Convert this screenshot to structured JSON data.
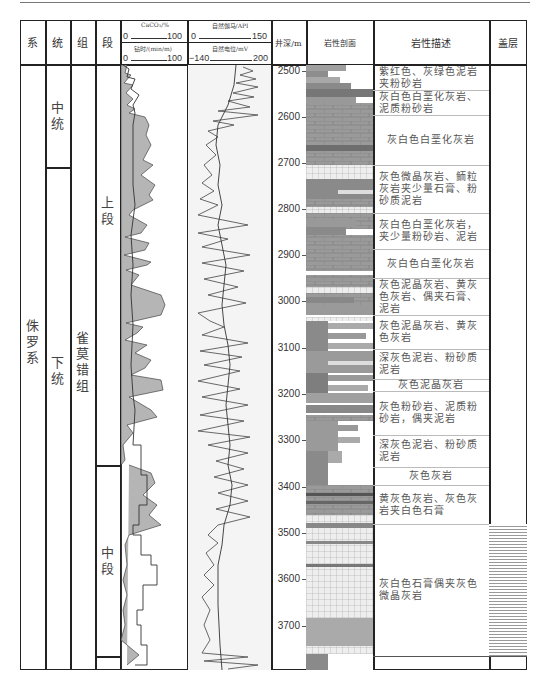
{
  "header": {
    "system": "系",
    "series": "统",
    "formation": "组",
    "member": "段",
    "caco3_label": "CaCO₃/%",
    "caco3_min": "0",
    "caco3_max": "100",
    "drill_label": "钻时/(min/m)",
    "drill_min": "0",
    "drill_max": "100",
    "gr_label": "自然伽马/API",
    "gr_min": "0",
    "gr_max": "150",
    "sp_label": "自然电位/mV",
    "sp_min": "−140",
    "sp_max": "200",
    "depth": "井深/m",
    "litho_profile": "岩性剖面",
    "litho_desc": "岩性描述",
    "caprock": "盖层"
  },
  "strat": {
    "system": "侏罗系",
    "series": [
      {
        "name": "中统",
        "top": 65,
        "bottom": 168
      },
      {
        "name": "下统",
        "top": 168,
        "bottom": 670
      }
    ],
    "formation": "雀莫错组",
    "members": [
      {
        "name": "上段",
        "top": 65,
        "bottom": 465
      },
      {
        "name": "中段",
        "top": 465,
        "bottom": 656
      },
      {
        "name": "",
        "top": 656,
        "bottom": 670
      }
    ]
  },
  "depth_ticks": [
    {
      "label": "2500",
      "y": 70
    },
    {
      "label": "2600",
      "y": 116
    },
    {
      "label": "2700",
      "y": 162
    },
    {
      "label": "2800",
      "y": 208
    },
    {
      "label": "2900",
      "y": 254
    },
    {
      "label": "3000",
      "y": 300
    },
    {
      "label": "3100",
      "y": 347
    },
    {
      "label": "3200",
      "y": 393
    },
    {
      "label": "3300",
      "y": 439
    },
    {
      "label": "3400",
      "y": 486
    },
    {
      "label": "3500",
      "y": 532
    },
    {
      "label": "3600",
      "y": 578
    },
    {
      "label": "3700",
      "y": 625
    }
  ],
  "descriptions": [
    {
      "text": "紫红色、灰绿色泥岩夹粉砂岩",
      "top": 65,
      "bottom": 90
    },
    {
      "text": "灰白色白垩化灰岩、泥质粉砂岩",
      "top": 90,
      "bottom": 115
    },
    {
      "text": "灰白色白垩化灰岩",
      "top": 115,
      "bottom": 165
    },
    {
      "text": "灰色微晶灰岩、鲕粒灰岩夹少量石膏、粉砂质泥岩",
      "top": 165,
      "bottom": 213
    },
    {
      "text": "灰白色白垩化灰岩，夹少量粉砂岩、泥岩",
      "top": 213,
      "bottom": 249
    },
    {
      "text": "灰白色白垩化灰岩",
      "top": 249,
      "bottom": 278
    },
    {
      "text": "灰色泥晶灰岩、黄灰色灰岩、偶夹石膏、泥岩",
      "top": 278,
      "bottom": 315
    },
    {
      "text": "灰色泥晶灰岩、黄灰色灰岩",
      "top": 315,
      "bottom": 349
    },
    {
      "text": "深灰色泥岩、粉砂质泥岩",
      "top": 349,
      "bottom": 379
    },
    {
      "text": "灰色泥晶灰岩",
      "top": 379,
      "bottom": 391
    },
    {
      "text": "灰色粉砂岩、泥质粉砂岩，偶夹泥岩",
      "top": 391,
      "bottom": 435
    },
    {
      "text": "深灰色泥岩、粉砂质泥岩",
      "top": 435,
      "bottom": 467
    },
    {
      "text": "灰色灰岩",
      "top": 467,
      "bottom": 485
    },
    {
      "text": "黄灰色灰岩、灰色灰岩夹白色石膏",
      "top": 485,
      "bottom": 524
    },
    {
      "text": "灰白色石膏偶夹灰色微晶灰岩",
      "top": 524,
      "bottom": 656
    },
    {
      "text": "",
      "top": 656,
      "bottom": 670
    }
  ],
  "caprock": {
    "top": 524,
    "bottom": 656,
    "pattern": "horizontal-lines"
  },
  "colors": {
    "grid": "#222222",
    "fill": "#b5b5b5",
    "litho_dark": "#8a8a8a",
    "litho_mid": "#a6a6a6",
    "litho_light": "#e8e8e8",
    "sp_bg": "#f2f2f2"
  }
}
